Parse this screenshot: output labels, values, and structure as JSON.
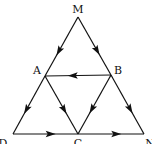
{
  "diagram": {
    "type": "directed-graph",
    "nodes": [
      {
        "id": "M",
        "label": "M",
        "x": 78,
        "y": 17,
        "lx": 78,
        "ly": 13
      },
      {
        "id": "A",
        "label": "A",
        "x": 45,
        "y": 76,
        "lx": 37,
        "ly": 74
      },
      {
        "id": "B",
        "label": "B",
        "x": 111,
        "y": 75,
        "lx": 118,
        "ly": 74
      },
      {
        "id": "D",
        "label": "D",
        "x": 13,
        "y": 134,
        "lx": 3,
        "ly": 147
      },
      {
        "id": "C",
        "label": "C",
        "x": 78,
        "y": 134,
        "lx": 78,
        "ly": 147
      },
      {
        "id": "N",
        "label": "N",
        "x": 144,
        "y": 134,
        "lx": 150,
        "ly": 147
      }
    ],
    "edges": [
      {
        "from": "M",
        "to": "A"
      },
      {
        "from": "M",
        "to": "B"
      },
      {
        "from": "B",
        "to": "A"
      },
      {
        "from": "A",
        "to": "D"
      },
      {
        "from": "A",
        "to": "C"
      },
      {
        "from": "B",
        "to": "C"
      },
      {
        "from": "B",
        "to": "N"
      },
      {
        "from": "D",
        "to": "C"
      },
      {
        "from": "C",
        "to": "N"
      }
    ],
    "colors": {
      "line": "#111111",
      "label": "#111111",
      "background": "#ffffff"
    }
  }
}
